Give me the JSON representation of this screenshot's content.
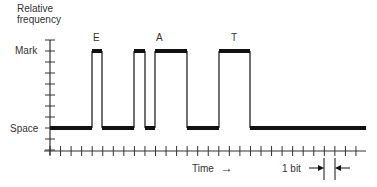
{
  "diagram": {
    "y_axis": {
      "label_line1": "Relative",
      "label_line2": "frequency",
      "levels": {
        "mark": "Mark",
        "space": "Space"
      }
    },
    "x_axis": {
      "label": "Time",
      "arrow": "→"
    },
    "bit_marker": {
      "label": "1 bit"
    },
    "letters": [
      {
        "text": "E",
        "x": 97
      },
      {
        "text": "A",
        "x": 159
      },
      {
        "text": "T",
        "x": 234
      }
    ],
    "waveform": {
      "description": "Two-level signal: Space (low) / Mark (high)",
      "segments": [
        {
          "level": "space",
          "from": 50,
          "to": 92
        },
        {
          "level": "mark",
          "from": 92,
          "to": 102
        },
        {
          "level": "space",
          "from": 102,
          "to": 134
        },
        {
          "level": "mark",
          "from": 134,
          "to": 145
        },
        {
          "level": "space",
          "from": 145,
          "to": 155
        },
        {
          "level": "mark",
          "from": 155,
          "to": 187
        },
        {
          "level": "space",
          "from": 187,
          "to": 219
        },
        {
          "level": "mark",
          "from": 219,
          "to": 250
        },
        {
          "level": "space",
          "from": 250,
          "to": 366
        }
      ]
    },
    "colors": {
      "line": "#111111",
      "axis": "#333333",
      "text": "#333333"
    }
  }
}
